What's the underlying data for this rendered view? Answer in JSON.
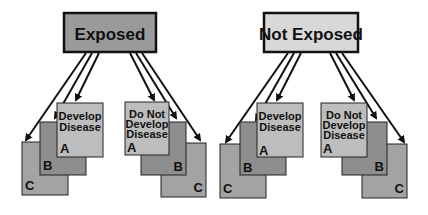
{
  "diagram": {
    "groups": [
      {
        "title": "Exposed",
        "title_fill": "#9a9a9a",
        "left_stack": {
          "text": [
            "Develop",
            "Disease"
          ],
          "cards": [
            "A",
            "B",
            "C"
          ]
        },
        "right_stack": {
          "text": [
            "Do Not",
            "Develop",
            "Disease"
          ],
          "cards": [
            "A",
            "B",
            "C"
          ]
        }
      },
      {
        "title": "Not Exposed",
        "title_fill": "#d8d8d8",
        "left_stack": {
          "text": [
            "Develop",
            "Disease"
          ],
          "cards": [
            "A",
            "B",
            "C"
          ]
        },
        "right_stack": {
          "text": [
            "Do Not",
            "Develop",
            "Disease"
          ],
          "cards": [
            "A",
            "B",
            "C"
          ]
        }
      }
    ],
    "colors": {
      "card_a": "#bdbdbd",
      "card_b": "#8e8e8e",
      "card_c": "#a3a3a3",
      "stroke": "#111111"
    }
  }
}
